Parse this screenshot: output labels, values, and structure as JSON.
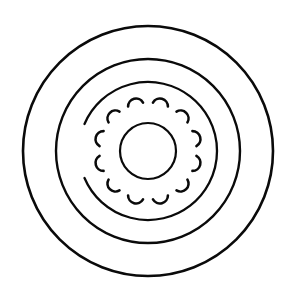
{
  "figure": {
    "background_color": "#ffffff",
    "ink_color": "#0a0a0a",
    "canvas": {
      "width": 293,
      "height": 295
    },
    "center": {
      "x": 148,
      "y": 151
    }
  },
  "rings": [
    {
      "name": "outer-rim-circle",
      "label": "Outer rim circle",
      "radius": 125,
      "stroke_width": 2.6,
      "start_angle_deg": 0,
      "end_angle_deg": 360,
      "complete": true
    },
    {
      "name": "inner-rim-circle",
      "label": "Inner rim circle",
      "radius": 92,
      "stroke_width": 2.4,
      "start_angle_deg": 0,
      "end_angle_deg": 360,
      "complete": true
    },
    {
      "name": "middle-broken-arc",
      "label": "Middle broken arc",
      "radius": 69,
      "stroke_width": 2.3,
      "start_angle_deg": 203,
      "end_angle_deg": 517,
      "complete": false,
      "gap_note": "open on the left side"
    }
  ],
  "crescent_ring": {
    "name": "crescent-ring",
    "label": "Ring of crescent marks",
    "count": 12,
    "orbit_radius": 46,
    "crescent_radius": 8,
    "crescent_sweep_deg": 150,
    "stroke_width": 2.6,
    "start_angle_deg": 255,
    "items": [
      {
        "index": 1,
        "angle_deg": 255
      },
      {
        "index": 2,
        "angle_deg": 285
      },
      {
        "index": 3,
        "angle_deg": 315
      },
      {
        "index": 4,
        "angle_deg": 345
      },
      {
        "index": 5,
        "angle_deg": 15
      },
      {
        "index": 6,
        "angle_deg": 45
      },
      {
        "index": 7,
        "angle_deg": 75
      },
      {
        "index": 8,
        "angle_deg": 105
      },
      {
        "index": 9,
        "angle_deg": 135
      },
      {
        "index": 10,
        "angle_deg": 165
      },
      {
        "index": 11,
        "angle_deg": 195
      },
      {
        "index": 12,
        "angle_deg": 225
      }
    ]
  },
  "core": {
    "name": "stippled-core",
    "label": "Stippled core disc",
    "radius": 28,
    "outline_stroke_width": 2.2,
    "fill_style": "mottled-stipple",
    "fill_color": "#111111",
    "speckle_count": 520,
    "speckle_seed": 20244
  }
}
